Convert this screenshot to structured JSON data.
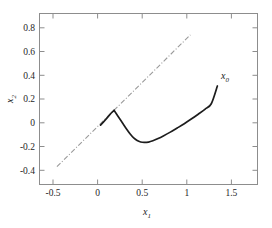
{
  "chart_data": {
    "type": "line",
    "title": "",
    "subtitle": "",
    "xlabel": "x",
    "xlabel_sub": "1",
    "ylabel": "x",
    "ylabel_sub": "2",
    "xlim": [
      -0.7,
      1.8
    ],
    "ylim": [
      -0.52,
      0.92
    ],
    "xticks": [
      -0.5,
      0,
      0.5,
      1,
      1.5
    ],
    "xtick_labels": [
      "-0.5",
      "0",
      "0.5",
      "1",
      "1.5"
    ],
    "yticks": [
      0.8,
      0.6,
      0.4,
      0.2,
      0,
      -0.2,
      -0.4
    ],
    "ytick_labels": [
      "0.8",
      "0.6",
      "0.4",
      "0.2",
      "0",
      "-0.2",
      "-0.4"
    ],
    "grid": false,
    "legend": "none",
    "frame": "box",
    "colors": {
      "trajectory": "#1d1d1d",
      "reference_line": "#9a9a9a",
      "axis": "#8d8d8d",
      "text": "#262626",
      "background": "#ffffff"
    },
    "annotations": [
      {
        "text": "x",
        "sub": "0",
        "x": 1.42,
        "y": 0.375,
        "name": "x0-annotation"
      }
    ],
    "series": [
      {
        "name": "reference-line",
        "style": "dash-dot",
        "color": "#9a9a9a",
        "x": [
          -0.5,
          1.03
        ],
        "y": [
          -0.37,
          0.74
        ]
      },
      {
        "name": "trajectory",
        "style": "solid",
        "color": "#1d1d1d",
        "x": [
          0.0,
          0.04,
          0.08,
          0.12,
          0.155,
          0.2,
          0.25,
          0.3,
          0.34,
          0.38,
          0.42,
          0.46,
          0.5,
          0.55,
          0.6,
          0.66,
          0.72,
          0.8,
          0.88,
          0.96,
          1.04,
          1.12,
          1.2,
          1.27,
          1.34
        ],
        "y": [
          -0.02,
          0.012,
          0.045,
          0.08,
          0.105,
          0.055,
          0.0,
          -0.055,
          -0.095,
          -0.128,
          -0.15,
          -0.162,
          -0.166,
          -0.163,
          -0.152,
          -0.133,
          -0.111,
          -0.079,
          -0.044,
          -0.008,
          0.031,
          0.072,
          0.115,
          0.16,
          0.31
        ]
      }
    ]
  }
}
